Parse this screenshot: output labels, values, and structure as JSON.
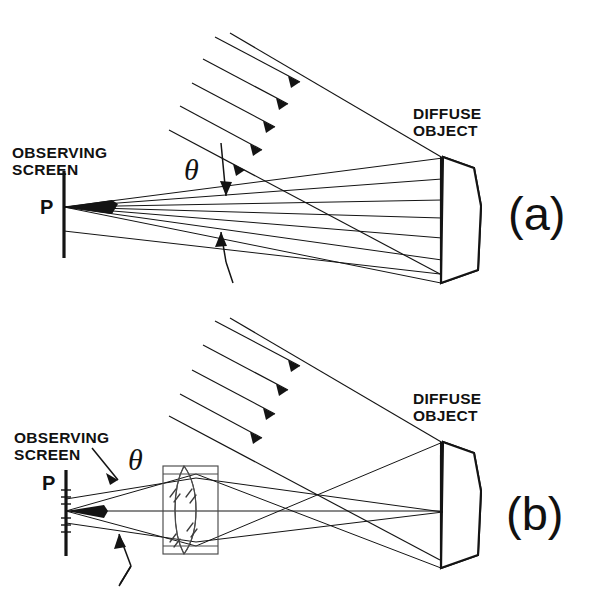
{
  "figure": {
    "background_color": "#ffffff",
    "ink_color": "#141414",
    "width": 596,
    "height": 602
  },
  "panels": [
    {
      "id": "a",
      "label": "(a)",
      "label_x": 508,
      "label_y": 230,
      "description": "Objective speckle formed directly on observing screen",
      "labels": {
        "observing_screen": "OBSERVING\nSCREEN",
        "observing_screen_line1": "OBSERVING",
        "observing_screen_line2": "SCREEN",
        "point": "P",
        "angle": "θ",
        "diffuse_object_line1": "DIFFUSE",
        "diffuse_object_line2": "OBJECT"
      },
      "illumination": {
        "ray_count": 4,
        "direction_degrees": 28,
        "style": "parallel arrows pointing down-right"
      },
      "speckle_fan": {
        "ray_count": 7,
        "converge_point": "P",
        "spread_symbol": "θ"
      }
    },
    {
      "id": "b",
      "label": "(b)",
      "label_x": 506,
      "label_y": 530,
      "description": "Subjective speckle formed through an imaging lens",
      "labels": {
        "observing_screen": "OBSERVING\nSCREEN",
        "observing_screen_line1": "OBSERVING",
        "observing_screen_line2": "SCREEN",
        "point": "P",
        "angle": "θ",
        "diffuse_object_line1": "DIFFUSE",
        "diffuse_object_line2": "OBJECT"
      },
      "illumination": {
        "ray_count": 4,
        "direction_degrees": 28,
        "style": "parallel arrows pointing down-right"
      },
      "optics": {
        "element": "biconvex lens in rectangular mount",
        "glass_marks": 6
      }
    }
  ],
  "elements": {
    "diffuse_object_fill": "diagonal hatching 45 degrees",
    "screen_symbol": "vertical bar",
    "angle_symbol": "θ"
  }
}
